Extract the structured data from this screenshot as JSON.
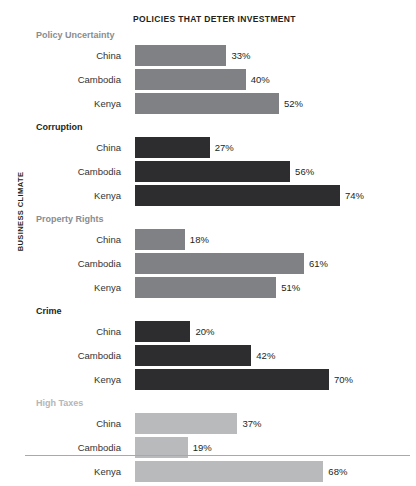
{
  "chart_data": {
    "type": "bar",
    "title": "POLICIES THAT DETER INVESTMENT",
    "xlabel": "",
    "ylabel": "BUSINESS CLIMATE",
    "orientation": "horizontal",
    "xlim": [
      0,
      100
    ],
    "grid": false,
    "legend": "none",
    "value_suffix": "%",
    "categories": [
      "China",
      "Cambodia",
      "Kenya"
    ],
    "groups": [
      {
        "name": "Policy Uncertainty",
        "tone": "mid",
        "color": "#7f8184",
        "label_color": "#8a8c8e",
        "rows": [
          {
            "label": "China",
            "value": 33,
            "display": "33%"
          },
          {
            "label": "Cambodia",
            "value": 40,
            "display": "40%"
          },
          {
            "label": "Kenya",
            "value": 52,
            "display": "52%"
          }
        ]
      },
      {
        "name": "Corruption",
        "tone": "dark",
        "color": "#2d2c2e",
        "label_color": "#231f20",
        "rows": [
          {
            "label": "China",
            "value": 27,
            "display": "27%"
          },
          {
            "label": "Cambodia",
            "value": 56,
            "display": "56%"
          },
          {
            "label": "Kenya",
            "value": 74,
            "display": "74%"
          }
        ]
      },
      {
        "name": "Property Rights",
        "tone": "mid",
        "color": "#7f8184",
        "label_color": "#8a8c8e",
        "rows": [
          {
            "label": "China",
            "value": 18,
            "display": "18%"
          },
          {
            "label": "Cambodia",
            "value": 61,
            "display": "61%"
          },
          {
            "label": "Kenya",
            "value": 51,
            "display": "51%"
          }
        ]
      },
      {
        "name": "Crime",
        "tone": "dark",
        "color": "#2d2c2e",
        "label_color": "#231f20",
        "rows": [
          {
            "label": "China",
            "value": 20,
            "display": "20%"
          },
          {
            "label": "Cambodia",
            "value": 42,
            "display": "42%"
          },
          {
            "label": "Kenya",
            "value": 70,
            "display": "70%"
          }
        ]
      },
      {
        "name": "High Taxes",
        "tone": "light",
        "color": "#b9babc",
        "label_color": "#b4b6b8",
        "rows": [
          {
            "label": "China",
            "value": 37,
            "display": "37%"
          },
          {
            "label": "Cambodia",
            "value": 19,
            "display": "19%"
          },
          {
            "label": "Kenya",
            "value": 68,
            "display": "68%"
          }
        ]
      }
    ]
  }
}
